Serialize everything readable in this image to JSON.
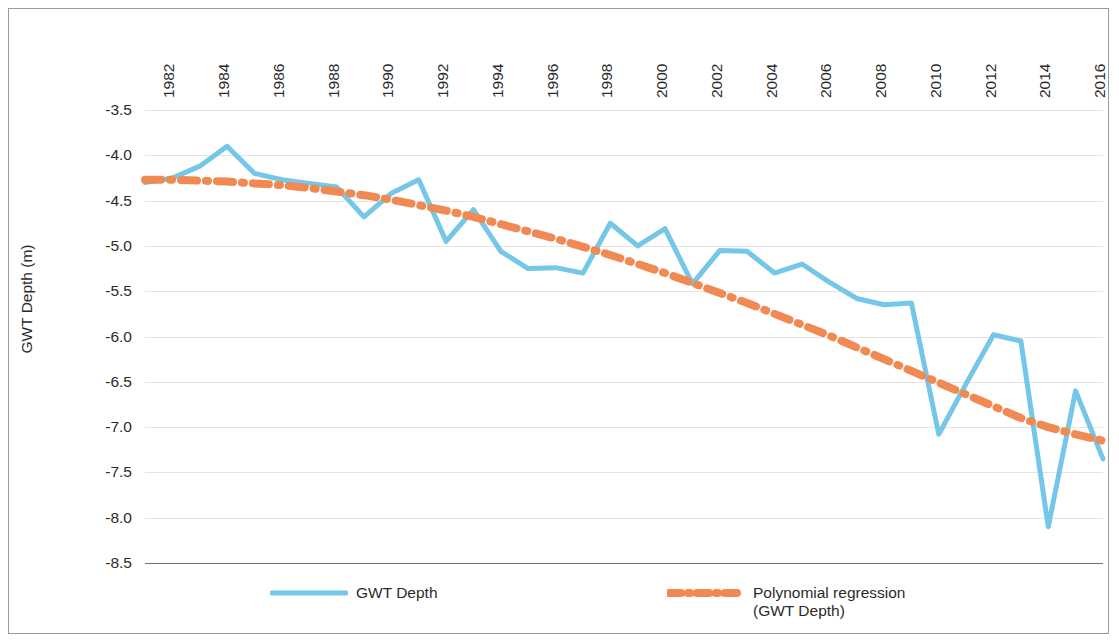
{
  "chart_data": {
    "type": "line",
    "title": "",
    "xlabel": "",
    "ylabel": "GWT Depth (m)",
    "xlim": [
      1981,
      2016
    ],
    "ylim": [
      -8.5,
      -3.5
    ],
    "grid": true,
    "legend_position": "bottom",
    "x": [
      1981,
      1982,
      1983,
      1984,
      1985,
      1986,
      1987,
      1988,
      1989,
      1990,
      1991,
      1992,
      1993,
      1994,
      1995,
      1996,
      1997,
      1998,
      1999,
      2000,
      2001,
      2002,
      2003,
      2004,
      2005,
      2006,
      2007,
      2008,
      2009,
      2010,
      2011,
      2012,
      2013,
      2014,
      2015,
      2016
    ],
    "xticks": [
      1982,
      1984,
      1986,
      1988,
      1990,
      1992,
      1994,
      1996,
      1998,
      2000,
      2002,
      2004,
      2006,
      2008,
      2010,
      2012,
      2014,
      2016
    ],
    "yticks": [
      -3.5,
      -4.0,
      -4.5,
      -5.0,
      -5.5,
      -6.0,
      -6.5,
      -7.0,
      -7.5,
      -8.0,
      -8.5
    ],
    "ytick_labels": [
      "-3.5",
      "-4.0",
      "-4.5",
      "-5.0",
      "-5.5",
      "-6.0",
      "-6.5",
      "-7.0",
      "-7.5",
      "-8.0",
      "-8.5"
    ],
    "series": [
      {
        "name": "GWT Depth",
        "color": "#74C7E8",
        "style": "solid",
        "values": [
          -4.3,
          -4.25,
          -4.12,
          -3.9,
          -4.2,
          -4.27,
          -4.31,
          -4.35,
          -4.68,
          -4.42,
          -4.27,
          -4.95,
          -4.6,
          -5.06,
          -5.25,
          -5.24,
          -5.3,
          -4.75,
          -5.0,
          -4.81,
          -5.42,
          -5.05,
          -5.06,
          -5.3,
          -5.2,
          -5.4,
          -5.58,
          -5.65,
          -5.63,
          -7.08,
          -6.52,
          -5.98,
          -6.05,
          -8.1,
          -6.6,
          -7.35
        ]
      },
      {
        "name": "Polynomial regression (GWT Depth)",
        "color": "#F08A52",
        "style": "dash-dot",
        "values": [
          -4.27,
          -4.27,
          -4.28,
          -4.29,
          -4.31,
          -4.33,
          -4.36,
          -4.4,
          -4.44,
          -4.49,
          -4.55,
          -4.61,
          -4.68,
          -4.76,
          -4.84,
          -4.92,
          -5.01,
          -5.1,
          -5.2,
          -5.3,
          -5.41,
          -5.52,
          -5.63,
          -5.75,
          -5.87,
          -5.99,
          -6.12,
          -6.25,
          -6.38,
          -6.51,
          -6.64,
          -6.77,
          -6.9,
          -7.0,
          -7.08,
          -7.15
        ]
      }
    ]
  },
  "legend": {
    "entries": [
      {
        "label": "GWT Depth"
      },
      {
        "label": "Polynomial regression\n(GWT Depth)"
      }
    ]
  }
}
